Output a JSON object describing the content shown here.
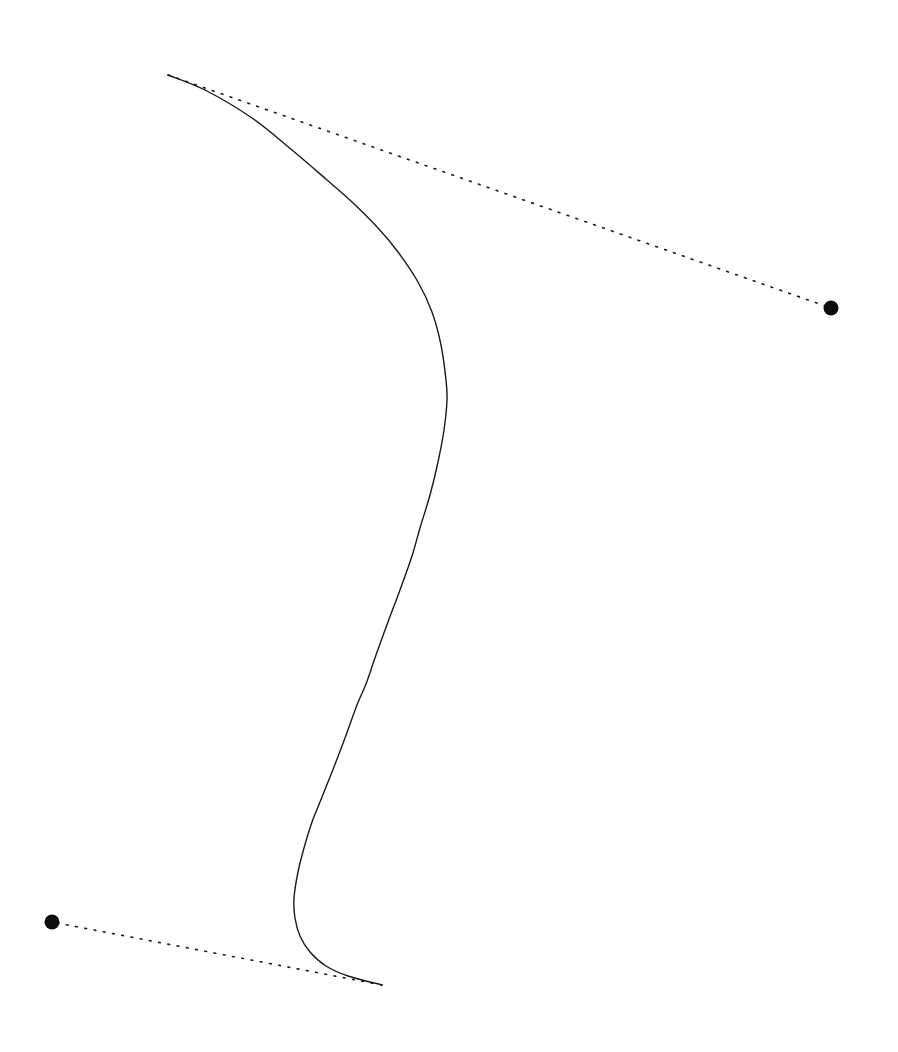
{
  "figure": {
    "width": 898,
    "height": 1052,
    "background_color": "#ffffff",
    "stroke_color": "#1a1a1a",
    "curve_stroke_width": 1.4,
    "tangent_stroke_width": 1.6,
    "tangent_dash_pattern": "1.8 7.6",
    "handle_radius": 7.5
  },
  "chart_data": {
    "type": "line",
    "xlabel": "",
    "ylabel": "",
    "xlim": [
      0,
      898
    ],
    "ylim": [
      1052,
      0
    ],
    "grid": false,
    "legend": "none",
    "series": [
      {
        "name": "curve",
        "style": "solid",
        "color": "#1a1a1a",
        "path_type": "cubic-bezier",
        "start_point": [
          168,
          75
        ],
        "end_point": [
          382,
          985
        ],
        "control_points": [
          [
            470,
            186
          ],
          [
            508,
            636
          ]
        ],
        "sampled_points": [
          [
            168,
            75
          ],
          [
            205,
            90
          ],
          [
            252,
            118
          ],
          [
            292,
            150
          ],
          [
            327,
            180
          ],
          [
            352,
            202
          ],
          [
            378,
            228
          ],
          [
            398,
            252
          ],
          [
            418,
            282
          ],
          [
            432,
            312
          ],
          [
            441,
            345
          ],
          [
            446,
            380
          ],
          [
            447,
            400
          ],
          [
            444,
            430
          ],
          [
            438,
            462
          ],
          [
            430,
            495
          ],
          [
            420,
            528
          ],
          [
            412,
            556
          ],
          [
            400,
            590
          ],
          [
            388,
            622
          ],
          [
            376,
            655
          ],
          [
            366,
            684
          ],
          [
            357,
            705
          ],
          [
            345,
            738
          ],
          [
            332,
            772
          ],
          [
            320,
            802
          ],
          [
            312,
            822
          ],
          [
            304,
            848
          ],
          [
            298,
            872
          ],
          [
            294,
            898
          ],
          [
            295,
            918
          ],
          [
            300,
            936
          ],
          [
            310,
            952
          ],
          [
            326,
            966
          ],
          [
            348,
            976
          ],
          [
            382,
            985
          ]
        ]
      },
      {
        "name": "tangent-upper",
        "style": "dotted",
        "color": "#1a1a1a",
        "from": [
          168,
          75
        ],
        "to": [
          831,
          308
        ],
        "anchor": "curve-start",
        "handle": "handle-upper-right"
      },
      {
        "name": "tangent-lower",
        "style": "dotted",
        "color": "#1a1a1a",
        "from": [
          382,
          985
        ],
        "to": [
          52,
          922
        ],
        "anchor": "curve-end",
        "handle": "handle-lower-left"
      }
    ],
    "handles": [
      {
        "name": "handle-upper-right",
        "x": 831,
        "y": 308,
        "radius": 7.5,
        "fill": "#0d0d0d"
      },
      {
        "name": "handle-lower-left",
        "x": 52,
        "y": 922,
        "radius": 7.5,
        "fill": "#0d0d0d"
      }
    ],
    "annotations": []
  }
}
